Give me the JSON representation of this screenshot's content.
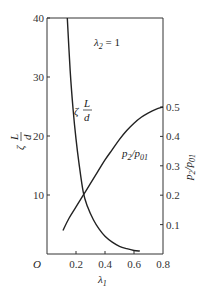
{
  "chart_data": {
    "type": "line",
    "title": "",
    "annotation": "λ2 = 1",
    "xlabel": "λ1",
    "ylabel_left": "ζ L/d",
    "ylabel_right": "p2/p01",
    "xlim": [
      0,
      0.8
    ],
    "ylim_left": [
      0,
      40
    ],
    "ylim_right": [
      0,
      0.5
    ],
    "x_ticks": [
      "O",
      "0.2",
      "0.4",
      "0.6",
      "0.8"
    ],
    "y_left_ticks": [
      "10",
      "20",
      "30",
      "40"
    ],
    "y_right_ticks": [
      "0.1",
      "0.2",
      "0.3",
      "0.4",
      "0.5"
    ],
    "grid": false,
    "series": [
      {
        "name": "ζ L/d",
        "axis": "left",
        "x": [
          0.14,
          0.16,
          0.18,
          0.2,
          0.22,
          0.25,
          0.28,
          0.32,
          0.36,
          0.4,
          0.45,
          0.5,
          0.55,
          0.6,
          0.64
        ],
        "y": [
          40,
          31,
          24.5,
          19.5,
          15.5,
          10.5,
          8.0,
          5.8,
          4.2,
          3.0,
          2.0,
          1.3,
          0.9,
          0.6,
          0.5
        ]
      },
      {
        "name": "p2/p01",
        "axis": "right",
        "x": [
          0.11,
          0.15,
          0.2,
          0.25,
          0.3,
          0.35,
          0.4,
          0.45,
          0.5,
          0.55,
          0.6,
          0.65,
          0.7,
          0.75,
          0.8
        ],
        "y": [
          0.08,
          0.12,
          0.16,
          0.2,
          0.24,
          0.28,
          0.32,
          0.355,
          0.39,
          0.42,
          0.445,
          0.465,
          0.48,
          0.492,
          0.5
        ]
      }
    ]
  },
  "labels": {
    "annotation_main": "λ",
    "annotation_sub": "2",
    "annotation_rest": " = 1",
    "zeta_curve_label": "ζ",
    "zeta_L": "L",
    "zeta_d": "d",
    "p_curve_label": "p",
    "p_sub1": "2",
    "p_slash": "/p",
    "p_sub2": "01",
    "left_axis_zeta": "ζ",
    "left_axis_L": "L",
    "left_axis_d": "d",
    "right_axis_label": "p2/p01",
    "x_axis_main": "λ",
    "x_axis_sub": "1"
  }
}
